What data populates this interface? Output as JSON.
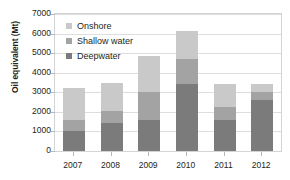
{
  "chart_data": {
    "type": "bar",
    "stacked": true,
    "title": "",
    "xlabel": "",
    "ylabel": "Oil equivalent (Mt)",
    "categories": [
      "2007",
      "2008",
      "2009",
      "2010",
      "2011",
      "2012"
    ],
    "series": [
      {
        "name": "Deepwater",
        "color": "#7b7b7b",
        "values": [
          1000,
          1430,
          1570,
          3430,
          1570,
          2600
        ]
      },
      {
        "name": "Shallow water",
        "color": "#a3a3a3",
        "values": [
          600,
          620,
          1430,
          1270,
          700,
          420
        ]
      },
      {
        "name": "Onshore",
        "color": "#c9c9c9",
        "values": [
          1600,
          1430,
          1850,
          1450,
          1130,
          400
        ]
      }
    ],
    "totals": [
      3200,
      3480,
      4850,
      6150,
      3400,
      3420
    ],
    "ylim": [
      0,
      7000
    ],
    "y_ticks": [
      0,
      1000,
      2000,
      3000,
      4000,
      5000,
      6000,
      7000
    ],
    "y_tick_labels": [
      "0",
      "1000",
      "2000",
      "3000",
      "4000",
      "5000",
      "6000",
      "7000"
    ],
    "grid": true,
    "legend_position": "top-left-inside",
    "legend_order": [
      "Onshore",
      "Shallow water",
      "Deepwater"
    ]
  }
}
